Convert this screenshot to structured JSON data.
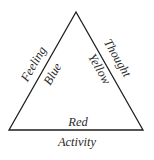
{
  "diagram": {
    "type": "triangle",
    "vertices": {
      "apex": [
        76,
        12
      ],
      "bottom_left": [
        9,
        130
      ],
      "bottom_right": [
        143,
        130
      ]
    },
    "sides": {
      "left": {
        "outer_label": "Feeling",
        "inner_label": "Blue"
      },
      "right": {
        "outer_label": "Thought",
        "inner_label": "Yellow"
      },
      "bottom": {
        "inner_label": "Red",
        "outer_label": "Activity"
      }
    },
    "colors": {
      "line": "#1e1e1e",
      "text": "#2a2a2a",
      "background": "#ffffff"
    }
  }
}
